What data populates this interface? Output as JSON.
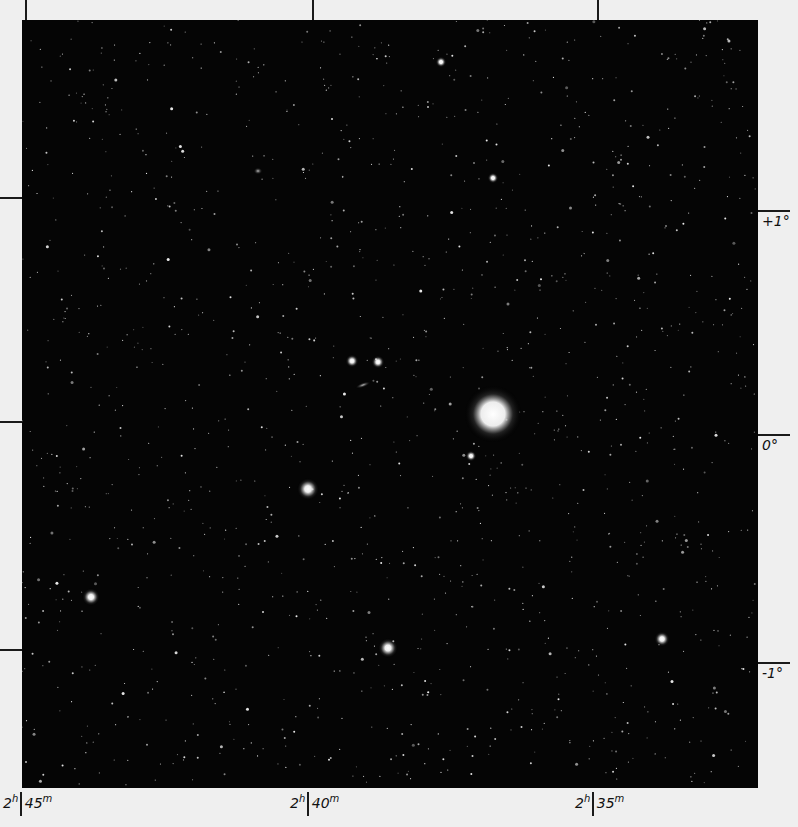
{
  "plate": {
    "background": "#050505",
    "border_color": "#efefef",
    "bounds": {
      "left": 22,
      "top": 20,
      "width": 736,
      "height": 768
    }
  },
  "axes": {
    "ra_ticks": [
      {
        "h": "2",
        "m": "45",
        "x": 25
      },
      {
        "h": "2",
        "m": "40",
        "x": 312
      },
      {
        "h": "2",
        "m": "35",
        "x": 597
      }
    ],
    "dec_ticks": [
      {
        "label": "+1°",
        "y": 197
      },
      {
        "label": "0°",
        "y": 421
      },
      {
        "label": "-1°",
        "y": 649
      }
    ],
    "ra_unit_h": "h",
    "ra_unit_m": "m"
  },
  "bright_objects": [
    {
      "name": "bright-star-halo",
      "x": 493,
      "y": 414,
      "r": 13
    },
    {
      "name": "bright-star",
      "x": 308,
      "y": 489,
      "r": 5
    },
    {
      "name": "bright-star",
      "x": 388,
      "y": 648,
      "r": 4.5
    },
    {
      "name": "bright-star",
      "x": 91,
      "y": 597,
      "r": 4
    },
    {
      "name": "bright-star",
      "x": 662,
      "y": 639,
      "r": 3.5
    },
    {
      "name": "bright-star",
      "x": 352,
      "y": 361,
      "r": 3
    },
    {
      "name": "bright-star",
      "x": 378,
      "y": 362,
      "r": 3
    },
    {
      "name": "bright-star",
      "x": 441,
      "y": 62,
      "r": 2.5
    },
    {
      "name": "bright-star",
      "x": 493,
      "y": 178,
      "r": 2.5
    },
    {
      "name": "bright-star",
      "x": 471,
      "y": 456,
      "r": 2.5
    }
  ],
  "galaxies": [
    {
      "name": "edge-on-galaxy",
      "x": 363,
      "y": 385,
      "w": 16,
      "h": 5,
      "rot": -20
    },
    {
      "name": "faint-galaxy",
      "x": 258,
      "y": 171,
      "w": 9,
      "h": 7,
      "rot": 0
    }
  ],
  "starfield": {
    "count": 1400,
    "seed": 7
  }
}
